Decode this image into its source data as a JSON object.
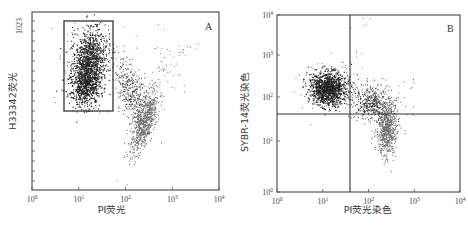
{
  "chart_data": [
    {
      "type": "scatter",
      "panel": "A",
      "title": "",
      "panel_label": "A",
      "xlabel": "PI荧光",
      "ylabel": "H33342荧光",
      "x_scale": "log",
      "xlim": [
        1,
        10000
      ],
      "x_ticks": [
        "10⁰",
        "10¹",
        "10²",
        "10³",
        "10⁴"
      ],
      "y_scale": "linear",
      "ylim": [
        0,
        1023
      ],
      "y_ticks": [
        "1023"
      ],
      "grid": false,
      "gate": {
        "shape": "rectangle",
        "x_range": [
          5,
          55
        ],
        "y_range": [
          560,
          1000
        ]
      },
      "populations": [
        {
          "name": "Live (gated)",
          "x_center": 15,
          "y_center": 780,
          "density": "high"
        },
        {
          "name": "Intermediate",
          "x_center": 140,
          "y_center": 600,
          "density": "medium"
        },
        {
          "name": "PI-high",
          "x_center": 280,
          "y_center": 460,
          "density": "high"
        }
      ]
    },
    {
      "type": "scatter",
      "panel": "B",
      "title": "",
      "panel_label": "B",
      "xlabel": "PI荧光染色",
      "ylabel": "SYBR-14荧光染色",
      "x_scale": "log",
      "xlim": [
        1,
        10000
      ],
      "x_ticks": [
        "10⁰",
        "10¹",
        "10²",
        "10³",
        "10⁴"
      ],
      "y_scale": "log",
      "ylim": [
        1,
        10000
      ],
      "y_ticks": [
        "10⁰",
        "10¹",
        "10²",
        "10³",
        "10⁴"
      ],
      "grid": false,
      "quadrant_lines": {
        "x": 40,
        "y": 45
      },
      "populations": [
        {
          "name": "SYBR-14+/PI-",
          "x_center": 15,
          "y_center": 150,
          "density": "high"
        },
        {
          "name": "SYBR-14+/PI+",
          "x_center": 120,
          "y_center": 80,
          "density": "medium"
        },
        {
          "name": "SYBR-14-/PI+",
          "x_center": 250,
          "y_center": 20,
          "density": "high"
        }
      ]
    }
  ],
  "panelA": {
    "letter": "A",
    "xlabel": "PI荧光",
    "ylabel": "H33342荧光",
    "ytop": "1023",
    "xticks": [
      {
        "b": "10",
        "e": "0"
      },
      {
        "b": "10",
        "e": "1"
      },
      {
        "b": "10",
        "e": "2"
      },
      {
        "b": "10",
        "e": "3"
      },
      {
        "b": "10",
        "e": "4"
      }
    ]
  },
  "panelB": {
    "letter": "B",
    "xlabel": "PI荧光染色",
    "ylabel": "SYBR-14荧光染色",
    "xticks": [
      {
        "b": "10",
        "e": "0"
      },
      {
        "b": "10",
        "e": "1"
      },
      {
        "b": "10",
        "e": "2"
      },
      {
        "b": "10",
        "e": "3"
      },
      {
        "b": "10",
        "e": "4"
      }
    ],
    "yticks": [
      {
        "b": "10",
        "e": "0"
      },
      {
        "b": "10",
        "e": "1"
      },
      {
        "b": "10",
        "e": "2"
      },
      {
        "b": "10",
        "e": "3"
      },
      {
        "b": "10",
        "e": "4"
      }
    ]
  },
  "colors": {
    "frame": "#555555",
    "dots": "#222222",
    "dots_dense": "#555555"
  }
}
